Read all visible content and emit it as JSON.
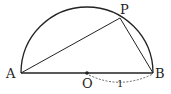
{
  "diagram": {
    "type": "semicircle-geometry",
    "points": {
      "A": {
        "label": "A",
        "x": 21,
        "y": 73
      },
      "B": {
        "label": "B",
        "x": 153,
        "y": 73
      },
      "O": {
        "label": "O",
        "x": 87,
        "y": 73
      },
      "P": {
        "label": "P",
        "x": 120,
        "y": 18
      }
    },
    "radius_label": "1",
    "stroke_color": "#222222"
  }
}
